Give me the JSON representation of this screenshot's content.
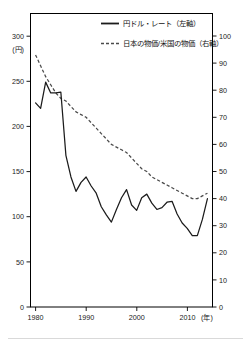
{
  "chart_data": {
    "type": "line",
    "title": "",
    "xlabel": "(年)",
    "ylabel": "(円)",
    "ylabel_right": "",
    "xlim": [
      1979,
      2015
    ],
    "ylim": [
      0,
      325
    ],
    "ylim_right": [
      0,
      108.3
    ],
    "grid": false,
    "legend_position": "top-center",
    "left_axis_unit": "(円)",
    "right_axis_unit": "",
    "x_axis_unit": "(年)",
    "yticks_left": [
      0,
      50,
      100,
      150,
      200,
      250,
      300
    ],
    "ytick_labels_left": [
      "0",
      "50",
      "100",
      "150",
      "200",
      "250",
      "300"
    ],
    "yticks_right": [
      0,
      10,
      20,
      30,
      40,
      50,
      60,
      70,
      80,
      90,
      100
    ],
    "ytick_labels_right": [
      "0",
      "10",
      "20",
      "30",
      "40",
      "50",
      "60",
      "70",
      "80",
      "90",
      "100"
    ],
    "xticks": [
      1980,
      1990,
      2000,
      2010
    ],
    "xtick_labels": [
      "1980",
      "1990",
      "2000",
      "2010"
    ],
    "series": [
      {
        "name": "円ドル・レート（左軸）",
        "axis": "left",
        "style": "solid",
        "x": [
          1980,
          1981,
          1982,
          1983,
          1984,
          1985,
          1986,
          1987,
          1988,
          1989,
          1990,
          1991,
          1992,
          1993,
          1994,
          1995,
          1996,
          1997,
          1998,
          1999,
          2000,
          2001,
          2002,
          2003,
          2004,
          2005,
          2006,
          2007,
          2008,
          2009,
          2010,
          2011,
          2012,
          2013,
          2014
        ],
        "values": [
          226,
          220,
          249,
          237,
          237,
          238,
          168,
          144,
          128,
          138,
          144,
          134,
          126,
          111,
          102,
          94,
          108,
          121,
          130,
          113,
          107,
          121,
          125,
          115,
          108,
          110,
          116,
          117,
          103,
          93,
          87,
          79,
          79,
          97,
          120
        ]
      },
      {
        "name": "日本の物価/米国の物価（右軸）",
        "axis": "right",
        "style": "dashed",
        "x": [
          1980,
          1981,
          1982,
          1983,
          1984,
          1985,
          1986,
          1987,
          1988,
          1989,
          1990,
          1991,
          1992,
          1993,
          1994,
          1995,
          1996,
          1997,
          1998,
          1999,
          2000,
          2001,
          2002,
          2003,
          2004,
          2005,
          2006,
          2007,
          2008,
          2009,
          2010,
          2011,
          2012,
          2013,
          2014
        ],
        "values": [
          93,
          89,
          85,
          82,
          79,
          77,
          76,
          74,
          72,
          71,
          70,
          68,
          66,
          64,
          62,
          60,
          59,
          58,
          57,
          55,
          53,
          51,
          50,
          48,
          47,
          46,
          45,
          44,
          43,
          42,
          41,
          40,
          40,
          41,
          42
        ]
      }
    ],
    "legend": [
      {
        "label": "円ドル・レート（左軸）",
        "style": "solid"
      },
      {
        "label": "日本の物価/米国の物価（右軸）",
        "style": "dashed"
      }
    ]
  }
}
